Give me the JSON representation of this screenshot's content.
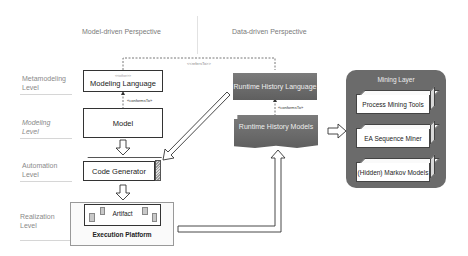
{
  "perspectives": {
    "model_driven": "Model-driven Perspective",
    "data_driven": "Data-driven Perspective"
  },
  "levels": [
    {
      "line1": "Metamodeling",
      "line2": "Level"
    },
    {
      "line1": "Modeling",
      "line2": "Level"
    },
    {
      "line1": "Automation",
      "line2": "Level"
    },
    {
      "line1": "Realization",
      "line2": "Level"
    }
  ],
  "model_driven": {
    "modeling_language": {
      "stereotype": "<<other>>",
      "title": "Modeling Language"
    },
    "conforms_to": "«conformsTo»",
    "model": "Model",
    "code_generator": "Code Generator",
    "artifact": "Artifact",
    "execution_platform": "Execution Platform"
  },
  "refers_to": "<<refersTo>>",
  "data_driven": {
    "runtime_history_language": "Runtime History Language",
    "conforms_to": "«conformsTo»",
    "runtime_history_models": "Runtime History Models"
  },
  "mining_layer": {
    "title": "Mining Layer",
    "tools": [
      "Process Mining Tools",
      "EA Sequence Miner",
      "(Hidden) Markov Models"
    ]
  },
  "colors": {
    "dark_box": "#6b6b6b",
    "border": "#333333",
    "level_text": "#8a8a8a"
  }
}
